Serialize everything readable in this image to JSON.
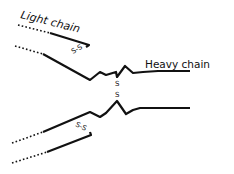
{
  "diagram": {
    "type": "antibody-structure",
    "labels": {
      "light_chain": "Light chain",
      "heavy_chain": "Heavy chain"
    },
    "disulfide_label": "S-S",
    "hinge_disulfide": [
      "S",
      "S"
    ],
    "colors": {
      "line": "#111111",
      "background": "#ffffff"
    }
  }
}
